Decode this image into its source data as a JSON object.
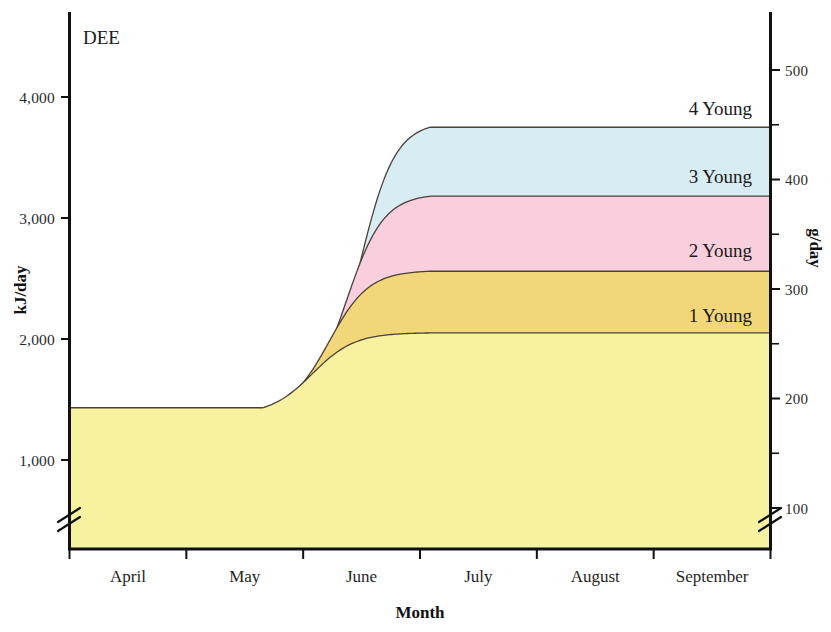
{
  "panel": {
    "label": "DEE"
  },
  "chart_data": {
    "type": "area",
    "title": "DEE",
    "subtitle": "",
    "xlabel": "Month",
    "ylabel": "kJ/day",
    "ylabel_right": "g/day",
    "stacked": true,
    "categories": [
      "April",
      "May",
      "June",
      "July",
      "August",
      "September"
    ],
    "x_tick_labels": [
      "April",
      "May",
      "June",
      "July",
      "August",
      "September"
    ],
    "y_tick_labels": [
      "1,000",
      "2,000",
      "3,000",
      "4,000"
    ],
    "y_tick_values": [
      1000,
      2000,
      3000,
      4000
    ],
    "ylim": [
      600,
      4350
    ],
    "y_axis_break": true,
    "y_right_tick_labels": [
      "100",
      "200",
      "300",
      "400",
      "500"
    ],
    "y_right_tick_values": [
      100,
      200,
      300,
      400,
      500
    ],
    "y_right_minor_tick_values": [
      150,
      250,
      350,
      450
    ],
    "y_right_lim": [
      72,
      523
    ],
    "y_right_axis_break": true,
    "grid": false,
    "legend_position": "inline-right",
    "baseline_value": 1430,
    "series": [
      {
        "name": "1 Young",
        "label": "1 Young",
        "color": "#f7f2a0",
        "plateau_value": 2050,
        "baseline_value": 1430
      },
      {
        "name": "2 Young",
        "label": "2 Young",
        "color": "#f2d77a",
        "plateau_value": 2560,
        "baseline_value": 1430
      },
      {
        "name": "3 Young",
        "label": "3 Young",
        "color": "#f9cfdd",
        "plateau_value": 3180,
        "baseline_value": 1430
      },
      {
        "name": "4 Young",
        "label": "4 Young",
        "color": "#d8ecf4",
        "plateau_value": 3750,
        "baseline_value": 1430
      }
    ],
    "annotations": [
      {
        "text": "4 Young",
        "value": 3750
      },
      {
        "text": "3 Young",
        "value": 3180
      },
      {
        "text": "2 Young",
        "value": 2560
      },
      {
        "text": "1 Young",
        "value": 2050
      }
    ],
    "colors": {
      "one_young": "#f7f2a0",
      "two_young": "#f2d77a",
      "three_young": "#f9cfdd",
      "four_young": "#d8ecf4",
      "axis": "#111111",
      "curve_outline": "#4a4038"
    }
  }
}
